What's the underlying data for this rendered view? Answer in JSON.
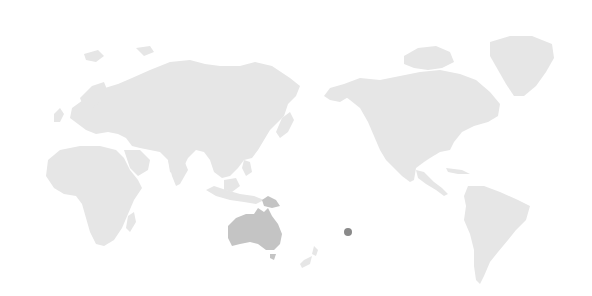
{
  "map": {
    "projection": "pacific-centered world map",
    "colors": {
      "background": "#ffffff",
      "land": "#e6e6e6",
      "highlight": "#c4c4c4",
      "marker": "#8a8a8a"
    },
    "highlighted_regions": [
      "Australia",
      "Papua New Guinea"
    ],
    "markers": [
      {
        "name": "location-marker",
        "x": 348,
        "y": 232,
        "radius": 4
      }
    ]
  }
}
